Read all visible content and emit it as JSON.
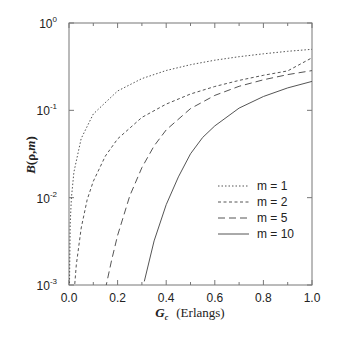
{
  "chart_data": {
    "type": "line",
    "title": "",
    "xlabel": "G_c (Erlangs)",
    "xlabel_main": "G",
    "xlabel_sub": "c",
    "xlabel_unit": "(Erlangs)",
    "ylabel": "B(ρ,m)",
    "ylabel_parts": [
      "B",
      "(ρ,",
      "m",
      ")"
    ],
    "xlim": [
      0.0,
      1.0
    ],
    "ylim": [
      0.001,
      1
    ],
    "yscale": "log",
    "grid": false,
    "legend_position": "center-right",
    "x_ticks": [
      "0.0",
      "0.2",
      "0.4",
      "0.6",
      "0.8",
      "1.0"
    ],
    "x_tick_values": [
      0.0,
      0.2,
      0.4,
      0.6,
      0.8,
      1.0
    ],
    "y_ticks": [
      {
        "base": "10",
        "exp": "0",
        "value": 1
      },
      {
        "base": "10",
        "exp": "-1",
        "value": 0.1
      },
      {
        "base": "10",
        "exp": "-2",
        "value": 0.01
      },
      {
        "base": "10",
        "exp": "-3",
        "value": 0.001
      }
    ],
    "series": [
      {
        "name": "m = 1",
        "m": 1,
        "style": "dotted",
        "x": [
          0.0,
          0.005,
          0.01,
          0.02,
          0.05,
          0.1,
          0.2,
          0.3,
          0.4,
          0.5,
          0.6,
          0.7,
          0.8,
          0.9,
          1.0
        ],
        "values": [
          0.0,
          0.005,
          0.0099,
          0.0196,
          0.0476,
          0.0909,
          0.1667,
          0.2308,
          0.2857,
          0.3333,
          0.375,
          0.4118,
          0.4444,
          0.4737,
          0.5
        ]
      },
      {
        "name": "m = 2",
        "m": 2,
        "style": "short-dash",
        "x": [
          0.02,
          0.03,
          0.05,
          0.075,
          0.1,
          0.15,
          0.2,
          0.3,
          0.4,
          0.5,
          0.6,
          0.7,
          0.8,
          0.9,
          1.0
        ],
        "values": [
          0.00077,
          0.0017,
          0.0045,
          0.0095,
          0.0154,
          0.03,
          0.0471,
          0.0831,
          0.118,
          0.1538,
          0.1875,
          0.2201,
          0.2519,
          0.2829,
          0.4
        ]
      },
      {
        "name": "m = 5",
        "m": 5,
        "style": "long-dash",
        "x": [
          0.15,
          0.175,
          0.2,
          0.25,
          0.3,
          0.35,
          0.4,
          0.5,
          0.6,
          0.7,
          0.8,
          0.9,
          1.0
        ],
        "values": [
          0.0009,
          0.0019,
          0.0037,
          0.0105,
          0.0221,
          0.0392,
          0.0597,
          0.1048,
          0.1484,
          0.1883,
          0.2239,
          0.2566,
          0.2849
        ]
      },
      {
        "name": "m = 10",
        "m": 10,
        "style": "solid",
        "x": [
          0.31,
          0.35,
          0.4,
          0.45,
          0.5,
          0.55,
          0.6,
          0.7,
          0.8,
          0.9,
          1.0
        ],
        "values": [
          0.0011,
          0.0032,
          0.0083,
          0.0173,
          0.0318,
          0.049,
          0.0664,
          0.1061,
          0.144,
          0.1808,
          0.2146
        ]
      }
    ]
  }
}
